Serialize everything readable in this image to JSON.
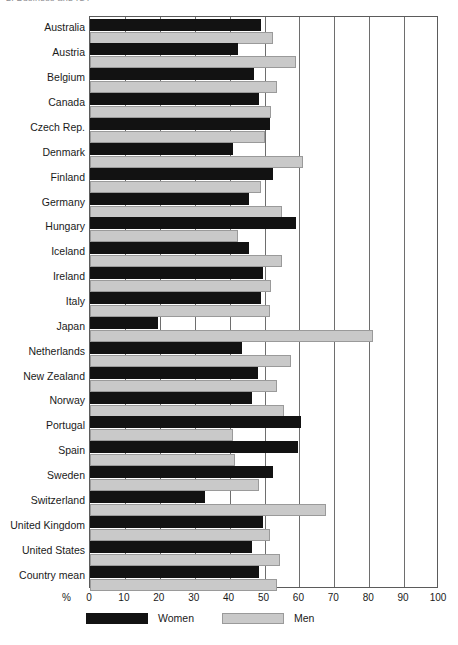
{
  "header": {
    "partial_text": "2. Business and ICT"
  },
  "legend": {
    "position": "bottom",
    "items": [
      {
        "label": "Women",
        "color": "#121212"
      },
      {
        "label": "Men",
        "color": "#c9c9c9"
      }
    ]
  },
  "axis": {
    "unit_label": "%",
    "ticks": [
      "0",
      "10",
      "20",
      "30",
      "40",
      "50",
      "60",
      "70",
      "80",
      "90",
      "100"
    ]
  },
  "chart_data": {
    "type": "bar",
    "orientation": "horizontal",
    "title": "",
    "subtitle": "",
    "xlabel": "%",
    "ylabel": "",
    "xlim": [
      0,
      100
    ],
    "grid": true,
    "legend_position": "bottom",
    "categories": [
      "Australia",
      "Austria",
      "Belgium",
      "Canada",
      "Czech Rep.",
      "Denmark",
      "Finland",
      "Germany",
      "Hungary",
      "Iceland",
      "Ireland",
      "Italy",
      "Japan",
      "Netherlands",
      "New Zealand",
      "Norway",
      "Portugal",
      "Spain",
      "Sweden",
      "Switzerland",
      "United Kingdom",
      "United States",
      "Country mean"
    ],
    "series": [
      {
        "name": "Women",
        "color": "#121212",
        "values": [
          49.0,
          42.5,
          47.0,
          48.5,
          51.5,
          41.0,
          52.5,
          45.5,
          59.0,
          45.5,
          49.5,
          49.0,
          19.5,
          43.5,
          48.0,
          46.5,
          60.5,
          59.5,
          52.5,
          33.0,
          49.5,
          46.5,
          48.5
        ]
      },
      {
        "name": "Men",
        "color": "#c9c9c9",
        "values": [
          52.5,
          59.0,
          53.5,
          52.0,
          50.0,
          61.0,
          49.0,
          55.0,
          42.5,
          55.0,
          52.0,
          51.5,
          81.0,
          57.5,
          53.5,
          55.5,
          41.0,
          41.5,
          48.5,
          67.5,
          51.5,
          54.5,
          53.5
        ]
      }
    ]
  }
}
